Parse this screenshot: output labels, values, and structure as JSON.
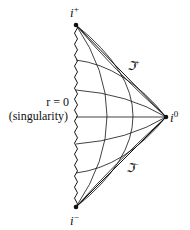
{
  "diagram": {
    "type": "penrose-diagram",
    "points": {
      "future_timelike_infinity": {
        "label": "i",
        "sup": "+"
      },
      "spatial_infinity": {
        "label": "i",
        "sup": "0"
      },
      "past_timelike_infinity": {
        "label": "i",
        "sup": "−"
      }
    },
    "null_infinity": {
      "future": {
        "label": "ℑ",
        "sup": "+"
      },
      "past": {
        "label": "ℑ",
        "sup": "−"
      }
    },
    "singularity": {
      "line1": "r = 0",
      "line2": "(singularity)"
    },
    "colors": {
      "stroke": "#111111",
      "background": "#ffffff"
    }
  }
}
